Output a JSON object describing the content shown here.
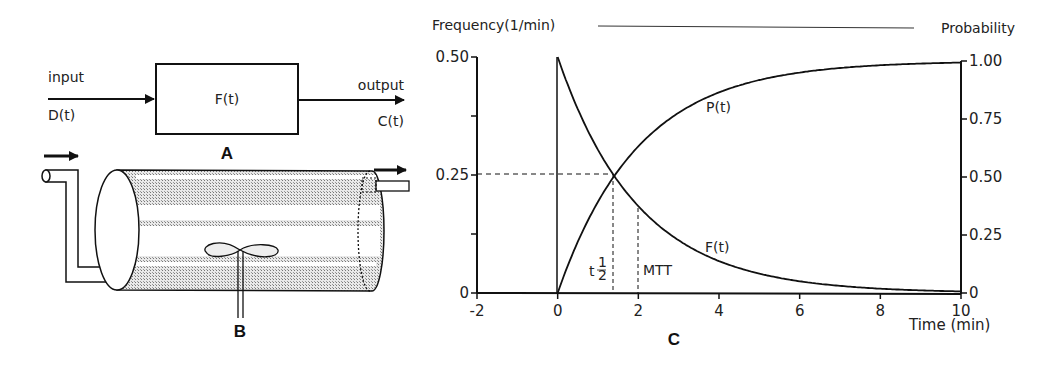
{
  "panel_a": {
    "label": "A",
    "input_label": "input",
    "input_fn": "D(t)",
    "box_label": "F(t)",
    "output_label": "output",
    "output_fn": "C(t)"
  },
  "panel_b": {
    "label": "B"
  },
  "panel_c": {
    "label": "C",
    "left_axis_title": "Frequency(1/min)",
    "right_axis_title": "Probability",
    "x_axis_title": "Time (min)",
    "curve_p_label": "P(t)",
    "curve_f_label": "F(t)",
    "half_life_label": "t",
    "half_num": "1",
    "half_den": "2",
    "mtt_label": "MTT",
    "left_ticks": [
      "0",
      "0.25",
      "0.50"
    ],
    "right_ticks": [
      "0",
      "0.25",
      "0.50",
      "0.75",
      "1.00"
    ],
    "x_ticks": [
      "-2",
      "0",
      "2",
      "4",
      "6",
      "8",
      "10"
    ]
  },
  "chart_data": {
    "type": "line",
    "title": "",
    "xlabel": "Time (min)",
    "ylabel": "Frequency (1/min)",
    "y2label": "Probability",
    "xlim": [
      -2,
      10
    ],
    "ylim": [
      0,
      0.5
    ],
    "y2lim": [
      0,
      1.0
    ],
    "x": [
      0,
      1,
      1.386,
      2,
      3,
      4,
      5,
      6,
      7,
      8,
      9,
      10
    ],
    "series": [
      {
        "name": "F(t)",
        "axis": "left",
        "values": [
          0.5,
          0.303,
          0.25,
          0.184,
          0.112,
          0.068,
          0.041,
          0.025,
          0.015,
          0.009,
          0.006,
          0.003
        ]
      },
      {
        "name": "P(t)",
        "axis": "right",
        "values": [
          0,
          0.393,
          0.5,
          0.632,
          0.777,
          0.865,
          0.918,
          0.95,
          0.97,
          0.982,
          0.989,
          0.993
        ]
      }
    ],
    "annotations": [
      {
        "text": "t½",
        "x": 1.386,
        "note": "half-life, dashed line where F(t)=0.25 and P(t)=0.50"
      },
      {
        "text": "MTT",
        "x": 2,
        "note": "mean transit time, dashed line"
      }
    ],
    "grid": false,
    "legend": "inline labels"
  }
}
